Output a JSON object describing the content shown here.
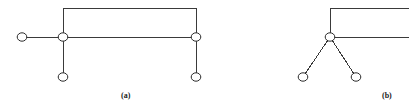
{
  "figure": {
    "width": 409,
    "height": 109,
    "background_color": "#ffffff",
    "line_color": "#3a3a3a",
    "node_stroke_color": "#2b2b2b",
    "node_fill_color": "#ffffff",
    "line_width": 1,
    "node_radius": 4.2,
    "panels": [
      {
        "id": "panel-a",
        "caption": "(a)",
        "caption_x": 121,
        "caption_y": 92,
        "description": "portal-frame-with-pinned-supports",
        "nodes": [
          {
            "name": "left-free-end-node",
            "x": 22,
            "y": 37,
            "type": "open-circle"
          },
          {
            "name": "left-joint-node",
            "x": 63,
            "y": 37,
            "type": "open-circle"
          },
          {
            "name": "right-joint-node",
            "x": 196,
            "y": 37,
            "type": "open-circle"
          },
          {
            "name": "left-support-node",
            "x": 63,
            "y": 77,
            "type": "open-circle"
          },
          {
            "name": "right-support-node",
            "x": 196,
            "y": 77,
            "type": "open-circle"
          }
        ],
        "members": [
          {
            "name": "left-cantilever-member",
            "x1": 22,
            "y1": 37,
            "x2": 63,
            "y2": 37
          },
          {
            "name": "middle-horizontal-member",
            "x1": 63,
            "y1": 37,
            "x2": 196,
            "y2": 37
          },
          {
            "name": "left-upper-column-member",
            "x1": 63,
            "y1": 8,
            "x2": 63,
            "y2": 37
          },
          {
            "name": "right-upper-column-member",
            "x1": 196,
            "y1": 8,
            "x2": 196,
            "y2": 37
          },
          {
            "name": "top-horizontal-member",
            "x1": 63,
            "y1": 8,
            "x2": 196,
            "y2": 8
          },
          {
            "name": "left-lower-column-member",
            "x1": 63,
            "y1": 37,
            "x2": 63,
            "y2": 77
          },
          {
            "name": "right-lower-column-member",
            "x1": 196,
            "y1": 37,
            "x2": 196,
            "y2": 77
          }
        ]
      },
      {
        "id": "panel-b",
        "caption": "(b)",
        "caption_x": 382,
        "caption_y": 92,
        "description": "inclined-two-legged-frame-clipped-at-right-edge",
        "nodes": [
          {
            "name": "apex-joint-node",
            "x": 330,
            "y": 37,
            "type": "open-circle"
          },
          {
            "name": "left-inclined-support-node",
            "x": 303,
            "y": 77,
            "type": "open-circle"
          },
          {
            "name": "right-inclined-support-node",
            "x": 356,
            "y": 77,
            "type": "open-circle"
          }
        ],
        "members": [
          {
            "name": "apex-upper-column-member",
            "x1": 330,
            "y1": 8,
            "x2": 330,
            "y2": 37
          },
          {
            "name": "top-horizontal-member-clipped",
            "x1": 330,
            "y1": 8,
            "x2": 409,
            "y2": 8
          },
          {
            "name": "apex-horizontal-member-clipped",
            "x1": 330,
            "y1": 37,
            "x2": 409,
            "y2": 37
          },
          {
            "name": "left-inclined-leg-member",
            "x1": 330,
            "y1": 37,
            "x2": 303,
            "y2": 77
          },
          {
            "name": "right-inclined-leg-member",
            "x1": 330,
            "y1": 37,
            "x2": 356,
            "y2": 77
          }
        ]
      }
    ]
  }
}
